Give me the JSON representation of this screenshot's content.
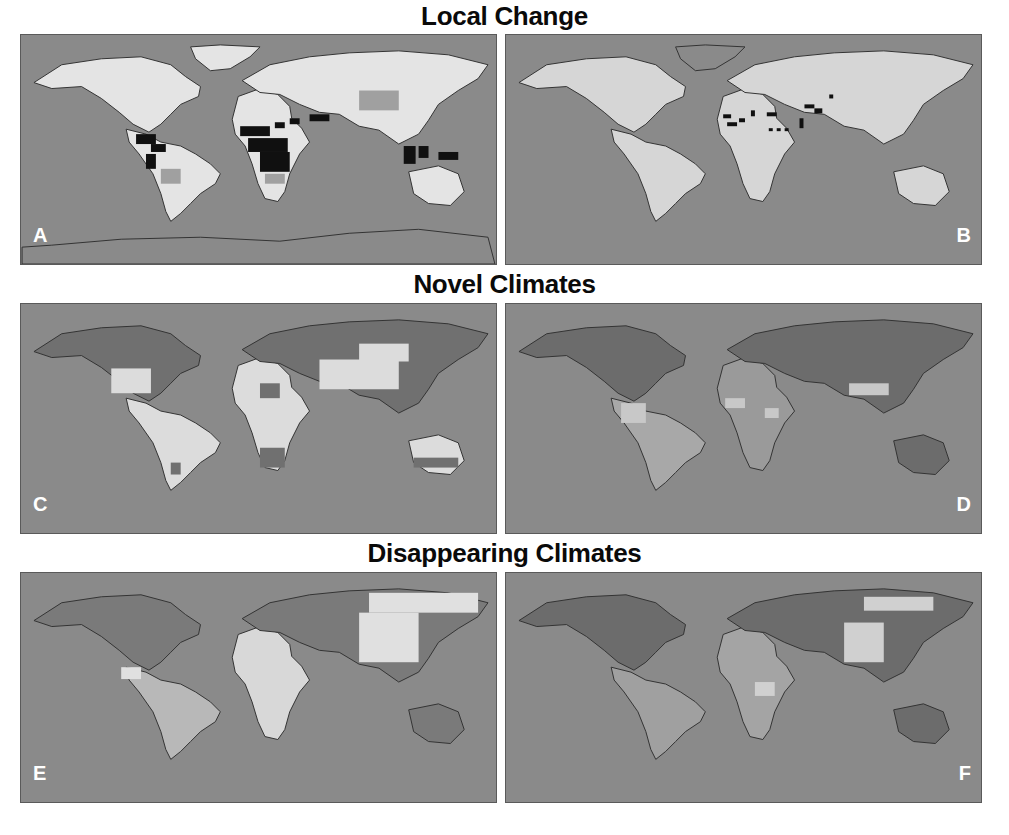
{
  "figure": {
    "rows": [
      {
        "title": "Local Change",
        "panels": [
          {
            "label": "A"
          },
          {
            "label": "B"
          }
        ]
      },
      {
        "title": "Novel Climates",
        "panels": [
          {
            "label": "C"
          },
          {
            "label": "D"
          }
        ]
      },
      {
        "title": "Disappearing Climates",
        "panels": [
          {
            "label": "E"
          },
          {
            "label": "F"
          }
        ]
      }
    ]
  },
  "colors": {
    "ocean": "#8a8a8a",
    "land_light": "#e4e4e4",
    "land_mid": "#b4b4b4",
    "land_dark": "#707070",
    "land_black": "#111111",
    "coast": "#333333",
    "label": "#ffffff",
    "title": "#0a0a0a"
  }
}
